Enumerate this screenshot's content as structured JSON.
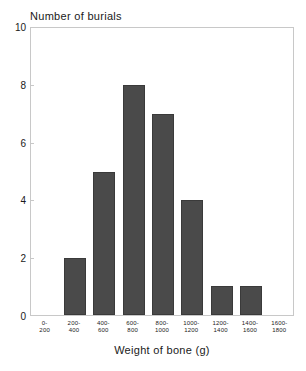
{
  "chart_data": {
    "type": "bar",
    "title": "",
    "xlabel": "Weight of bone (g)",
    "ylabel": "Number of burials",
    "categories": [
      "0-200",
      "200-400",
      "400-600",
      "600-800",
      "800-1000",
      "1000-1200",
      "1200-1400",
      "1400-1600",
      "1600-1800"
    ],
    "category_lines": [
      {
        "line1": "0-",
        "line2": "200"
      },
      {
        "line1": "200-",
        "line2": "400"
      },
      {
        "line1": "400-",
        "line2": "600"
      },
      {
        "line1": "600-",
        "line2": "800"
      },
      {
        "line1": "800-",
        "line2": "1000"
      },
      {
        "line1": "1000-",
        "line2": "1200"
      },
      {
        "line1": "1200-",
        "line2": "1400"
      },
      {
        "line1": "1400-",
        "line2": "1600"
      },
      {
        "line1": "1600-",
        "line2": "1800"
      }
    ],
    "values": [
      0,
      2,
      5,
      8,
      7,
      4,
      1,
      1,
      0
    ],
    "ylim": [
      0,
      10
    ],
    "yticks": [
      0,
      2,
      4,
      6,
      8,
      10
    ],
    "ytick_labels": [
      "0",
      "2",
      "4",
      "6",
      "8",
      "10"
    ],
    "grid": false,
    "legend": false,
    "bar_color": "#4a4a4a",
    "bar_edge_color": "#3a3a3a",
    "frame_color": "#c8c8c8"
  }
}
